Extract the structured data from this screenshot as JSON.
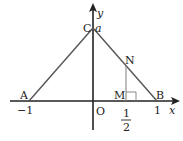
{
  "diagram": {
    "type": "coordinate-geometry",
    "axes": {
      "x_label": "x",
      "y_label": "y",
      "origin_label": "O"
    },
    "points": {
      "A": {
        "label": "A",
        "coord_label": "−1"
      },
      "B": {
        "label": "B",
        "coord_label": "1"
      },
      "C": {
        "label": "C",
        "coord_label": "a"
      },
      "M": {
        "label": "M",
        "coord_num": "1",
        "coord_den": "2"
      },
      "N": {
        "label": "N"
      }
    },
    "colors": {
      "axis": "#222222",
      "triangle": "#555555",
      "segment": "#888888"
    }
  }
}
